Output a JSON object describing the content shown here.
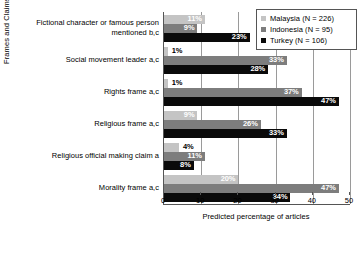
{
  "chart_data": {
    "type": "bar",
    "orientation": "horizontal",
    "title": "",
    "xlabel": "Predicted percentage of articles",
    "ylabel": "Frames and Claimsmakers",
    "xlim": [
      0,
      50
    ],
    "xticks": [
      0,
      10,
      20,
      30,
      40,
      50
    ],
    "xtick_labels": [
      "0",
      "10",
      "20",
      "30",
      "40",
      "50"
    ],
    "grid": "vertical",
    "legend_position": "top-right",
    "categories": [
      "Fictional character or famous person mentioned b,c",
      "Social movement leader a,c",
      "Rights frame a,c",
      "Religious frame a,c",
      "Religious official making claim a",
      "Morality frame a,c"
    ],
    "category_lines": [
      [
        "Fictional character or famous person",
        "mentioned b,c"
      ],
      [
        "Social movement leader a,c"
      ],
      [
        "Rights frame a,c"
      ],
      [
        "Religious frame a,c"
      ],
      [
        "Religious official making claim a"
      ],
      [
        "Morality frame a,c"
      ]
    ],
    "series": [
      {
        "name": "Malaysia (N = 226)",
        "color": "#c4c4c4",
        "values": [
          11,
          1,
          1,
          9,
          4,
          20
        ],
        "labels": [
          "11%",
          "1%",
          "1%",
          "9%",
          "4%",
          "20%"
        ]
      },
      {
        "name": "Indonesia (N = 95)",
        "color": "#7d7d7d",
        "values": [
          9,
          33,
          37,
          26,
          11,
          47
        ],
        "labels": [
          "9%",
          "33%",
          "37%",
          "26%",
          "11%",
          "47%"
        ]
      },
      {
        "name": "Turkey (N = 106)",
        "color": "#0a0a0a",
        "values": [
          23,
          28,
          47,
          33,
          8,
          34
        ],
        "labels": [
          "23%",
          "28%",
          "47%",
          "33%",
          "8%",
          "34%"
        ]
      }
    ]
  },
  "legend": {
    "items": [
      {
        "label": "Malaysia (N = 226)"
      },
      {
        "label": "Indonesia (N = 95)"
      },
      {
        "label": "Turkey (N = 106)"
      }
    ]
  },
  "axes": {
    "x_title": "Predicted percentage of articles",
    "y_title": "Frames and Claimsmakers"
  }
}
